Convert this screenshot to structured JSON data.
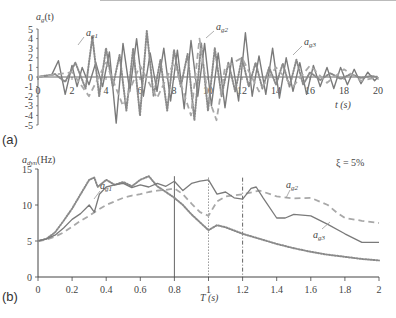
{
  "chart_data": [
    {
      "panel": "(a)",
      "type": "line",
      "title": "",
      "xlabel": "t (s)",
      "ylabel": "a_g(t)",
      "xlim": [
        0,
        20
      ],
      "ylim": [
        -5,
        5
      ],
      "xticks": [
        0,
        2,
        4,
        6,
        8,
        10,
        12,
        14,
        16,
        18,
        20
      ],
      "yticks": [
        5,
        4,
        3,
        2,
        1,
        0,
        -1,
        -2,
        -3,
        -4,
        -5
      ],
      "grid": false,
      "series": [
        {
          "name": "a_g1",
          "style": "solid-thin",
          "x": [
            0,
            0.8,
            1.2,
            1.6,
            2.0,
            2.3,
            2.6,
            3.0,
            3.4,
            3.8,
            4.2,
            4.6,
            5.0,
            5.4,
            5.8,
            6.2,
            6.6,
            7.0,
            7.4,
            7.8,
            8.2,
            8.6,
            9.0,
            9.4,
            9.8,
            10.2,
            10.6,
            11.0,
            11.4,
            11.8,
            12.2,
            12.6,
            13.0,
            13.4,
            13.8,
            14.2,
            14.6,
            15.0,
            15.4,
            15.8,
            16.2,
            16.6,
            17.0,
            17.4,
            17.8,
            18.2,
            18.6,
            19.0,
            19.4,
            19.8,
            20
          ],
          "y": [
            0,
            0.2,
            1.7,
            -1.8,
            1.2,
            -1.0,
            1.0,
            -0.8,
            1.5,
            -1.0,
            2.6,
            -4.8,
            3.5,
            -1.5,
            4.0,
            -2.0,
            2.5,
            -1.5,
            3.0,
            -2.5,
            2.8,
            -3.3,
            3.8,
            -2.0,
            3.5,
            -3.0,
            2.5,
            -3.2,
            2.0,
            -2.5,
            4.6,
            -2.0,
            2.2,
            -1.8,
            3.0,
            -2.2,
            2.0,
            -1.5,
            1.5,
            -1.8,
            1.2,
            -1.0,
            1.0,
            -1.2,
            1.0,
            -0.8,
            0.8,
            -0.7,
            0.5,
            -0.4,
            0
          ]
        },
        {
          "name": "a_g2",
          "style": "dotted",
          "x": [
            0,
            1.0,
            1.6,
            2.2,
            2.8,
            3.2,
            3.6,
            4.0,
            4.4,
            4.8,
            5.2,
            5.6,
            6.0,
            6.4,
            6.8,
            7.2,
            7.6,
            8.0,
            8.4,
            8.8,
            9.2,
            9.6,
            10.0,
            10.4,
            10.8,
            11.2,
            11.6,
            12.0,
            12.4,
            12.8,
            13.2,
            13.6,
            14.0,
            14.4,
            14.8,
            15.2,
            15.6,
            16.0,
            16.6,
            17.2,
            17.8,
            18.4,
            19.0,
            19.6,
            20
          ],
          "y": [
            0,
            0.3,
            -0.5,
            1.5,
            -1.2,
            4.2,
            -2.0,
            3.0,
            -1.0,
            2.3,
            -3.5,
            3.0,
            -4.0,
            4.8,
            -2.0,
            1.8,
            -3.5,
            2.8,
            -1.0,
            2.4,
            -4.5,
            3.5,
            -3.5,
            3.0,
            -2.0,
            1.5,
            -1.5,
            2.0,
            -1.0,
            1.5,
            -1.2,
            1.0,
            -0.8,
            1.4,
            -1.0,
            1.8,
            -0.8,
            0.5,
            -0.3,
            0.4,
            -0.2,
            0.3,
            -0.1,
            0.1,
            0
          ]
        },
        {
          "name": "a_g3",
          "style": "dashed",
          "x": [
            0,
            2.0,
            3.0,
            4.0,
            5.0,
            6.0,
            7.0,
            8.0,
            9.0,
            9.5,
            10.0,
            10.5,
            11.0,
            12.0,
            13.0,
            14.0,
            15.0,
            16.0,
            17.0,
            18.0,
            19.0,
            20
          ],
          "y": [
            0,
            0.5,
            -2.0,
            1.5,
            -3.0,
            1.2,
            -2.2,
            1.5,
            -4.0,
            4.0,
            -2.0,
            -4.5,
            1.0,
            2.0,
            -1.5,
            1.0,
            -1.0,
            1.2,
            -0.6,
            0.8,
            -0.4,
            0
          ]
        }
      ],
      "annotations": [
        "a_g1",
        "a_g2",
        "a_g3"
      ]
    },
    {
      "panel": "(b)",
      "type": "line",
      "title": "",
      "xlabel": "T (s)",
      "ylabel": "a_dyn(Hz)",
      "xlim": [
        0,
        2
      ],
      "ylim": [
        0,
        15
      ],
      "xticks": [
        0,
        0.2,
        0.4,
        0.6,
        0.8,
        1,
        1.2,
        1.4,
        1.6,
        1.8,
        2
      ],
      "yticks": [
        0,
        5,
        10,
        15
      ],
      "grid": false,
      "vertical_lines": [
        {
          "x": 0.8,
          "style": "solid"
        },
        {
          "x": 1.0,
          "style": "dotted"
        },
        {
          "x": 1.2,
          "style": "dash-dot"
        }
      ],
      "annotation_text": "ξ = 5%",
      "series": [
        {
          "name": "a_g1",
          "style": "dotted",
          "x": [
            0,
            0.05,
            0.1,
            0.15,
            0.2,
            0.25,
            0.3,
            0.33,
            0.35,
            0.4,
            0.45,
            0.5,
            0.55,
            0.6,
            0.65,
            0.7,
            0.75,
            0.8,
            0.85,
            0.9,
            0.95,
            1.0,
            1.05,
            1.1,
            1.2,
            1.3,
            1.4,
            1.5,
            1.6,
            1.7,
            1.8,
            1.9,
            2.0
          ],
          "y": [
            5,
            5.3,
            6.2,
            7.8,
            9.5,
            11.5,
            13.5,
            13.8,
            12.5,
            13.5,
            12.8,
            13.2,
            12.6,
            13.5,
            14.0,
            12.6,
            11.8,
            11.0,
            10.0,
            8.7,
            7.6,
            6.5,
            7.2,
            6.9,
            6.0,
            5.3,
            4.6,
            4.0,
            3.5,
            3.1,
            2.8,
            2.5,
            2.3
          ]
        },
        {
          "name": "a_g2",
          "style": "dashed",
          "x": [
            0,
            0.05,
            0.1,
            0.15,
            0.2,
            0.25,
            0.3,
            0.35,
            0.4,
            0.45,
            0.5,
            0.55,
            0.6,
            0.65,
            0.7,
            0.75,
            0.8,
            0.85,
            0.9,
            0.95,
            1.0,
            1.05,
            1.1,
            1.2,
            1.3,
            1.4,
            1.5,
            1.6,
            1.7,
            1.75,
            1.8,
            1.9,
            2.0
          ],
          "y": [
            5,
            5.2,
            5.6,
            6.2,
            7.0,
            7.8,
            8.5,
            9.3,
            10.0,
            10.5,
            11.0,
            11.3,
            11.5,
            11.8,
            12.0,
            12.1,
            12.3,
            11.5,
            10.2,
            9.0,
            8.5,
            10.5,
            11.2,
            11.5,
            12.0,
            11.2,
            10.9,
            11.0,
            10.0,
            9.0,
            8.2,
            7.8,
            7.5
          ]
        },
        {
          "name": "a_g3",
          "style": "solid",
          "x": [
            0,
            0.05,
            0.1,
            0.15,
            0.2,
            0.25,
            0.3,
            0.33,
            0.36,
            0.4,
            0.45,
            0.5,
            0.55,
            0.6,
            0.65,
            0.7,
            0.75,
            0.8,
            0.85,
            0.9,
            0.95,
            1.0,
            1.05,
            1.1,
            1.15,
            1.2,
            1.25,
            1.28,
            1.32,
            1.4,
            1.45,
            1.5,
            1.6,
            1.7,
            1.8,
            1.9,
            2.0
          ],
          "y": [
            5,
            5.3,
            5.8,
            6.8,
            8.0,
            8.8,
            10.0,
            9.0,
            11.5,
            12.5,
            12.8,
            13.0,
            12.4,
            12.8,
            12.5,
            13.0,
            12.6,
            13.3,
            12.0,
            13.0,
            13.3,
            13.5,
            11.5,
            11.8,
            11.0,
            10.8,
            12.3,
            12.5,
            11.0,
            8.2,
            8.2,
            8.7,
            8.5,
            7.3,
            6.0,
            4.8,
            4.8
          ]
        }
      ],
      "annotations": [
        "a_g1",
        "a_g2",
        "a_g3"
      ]
    }
  ],
  "labels": {
    "panel_a": "(a)",
    "panel_b": "(b)",
    "top_ylabel_main": "a",
    "top_ylabel_sub": "g",
    "top_ylabel_tail": "(t)",
    "top_xlabel": "t (s)",
    "bot_ylabel_main": "a",
    "bot_ylabel_sub": "dyn",
    "bot_ylabel_tail": "(Hz)",
    "bot_xlabel": "T (s)",
    "damping": "ξ = 5%",
    "ag1": "a",
    "ag2": "a",
    "ag3": "a",
    "ag1_sub": "g1",
    "ag2_sub": "g2",
    "ag3_sub": "g3"
  },
  "colors": {
    "line": "#777777",
    "dashed": "#a8a8a8",
    "axis": "#444444"
  }
}
